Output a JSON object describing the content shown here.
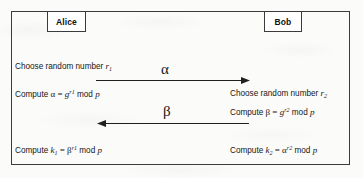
{
  "diagram": {
    "colors": {
      "ink": "#161616",
      "border": "#3b3b3b",
      "paper": "#fbfbfa",
      "box_fill": "#ffffff"
    },
    "frame": {
      "x": 11,
      "y": 11,
      "width": 339,
      "height": 154
    },
    "parties": [
      {
        "id": "alice",
        "label": "Alice",
        "x": 47,
        "y": 11,
        "width": 39,
        "height": 21
      },
      {
        "id": "bob",
        "label": "Bob",
        "x": 264,
        "y": 11,
        "width": 38,
        "height": 21
      }
    ],
    "left_column": {
      "choose_prefix": "Choose random number ",
      "choose_var": "r",
      "choose_sub": "1",
      "compute_prefix": "Compute ",
      "compute_lhs": "α",
      "equals": " = ",
      "base": "g",
      "exponent_var": "r",
      "exponent_sub": "1",
      "mod": " mod ",
      "modulus": "p",
      "key_prefix": "Compute ",
      "key_var": "k",
      "key_sub": "1",
      "key_base": "β",
      "key_exponent_var": "r",
      "key_exponent_sub": "1"
    },
    "right_column": {
      "choose_prefix": "Choose random number ",
      "choose_var": "r",
      "choose_sub": "2",
      "compute_prefix": "Compute ",
      "compute_lhs": "β",
      "equals": " = ",
      "base": "g",
      "exponent_var": "r",
      "exponent_sub": "2",
      "mod": " mod ",
      "modulus": "p",
      "key_prefix": "Compute ",
      "key_var": "k",
      "key_sub": "2",
      "key_base": "α",
      "key_exponent_var": "r",
      "key_exponent_sub": "2"
    },
    "messages": [
      {
        "id": "alice-to-bob",
        "label": "α",
        "direction": "right",
        "from": "alice",
        "to": "bob",
        "x1": 96,
        "x2": 248,
        "y": 80
      },
      {
        "id": "bob-to-alice",
        "label": "β",
        "direction": "left",
        "from": "bob",
        "to": "alice",
        "x1": 97,
        "x2": 248,
        "y": 123
      }
    ]
  }
}
